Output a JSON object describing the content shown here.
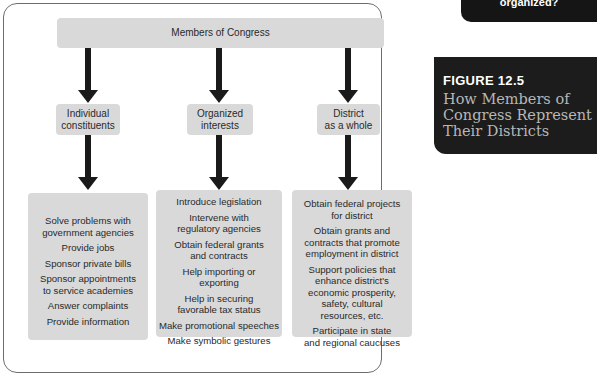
{
  "figure": {
    "label": "FIGURE 12.5",
    "title": "How Members of\nCongress Represent\nTheir Districts",
    "colors": {
      "panel_bg": "#1c1c1c",
      "label_color": "#ffffff",
      "title_color": "#b7b7b7",
      "box_fill": "#d9d9d9",
      "arrow_color": "#1a1a1a",
      "frame_border": "#6d6d6d"
    }
  },
  "top_cropped_box": {
    "text": "organized?"
  },
  "diagram": {
    "root": "Members of Congress",
    "branches": [
      {
        "label": "Individual\nconstituents",
        "items": [
          "Solve problems with\ngovernment agencies",
          "Provide jobs",
          "Sponsor private bills",
          "Sponsor appointments\nto service academies",
          "Answer complaints",
          "Provide information"
        ]
      },
      {
        "label": "Organized\ninterests",
        "items": [
          "Introduce legislation",
          "Intervene with\nregulatory agencies",
          "Obtain federal grants\nand contracts",
          "Help importing or\nexporting",
          "Help in securing\nfavorable tax status",
          "Make promotional speeches",
          "Make symbolic gestures"
        ]
      },
      {
        "label": "District\nas a whole",
        "items": [
          "Obtain federal projects\nfor district",
          "Obtain grants and\ncontracts that promote\nemployment in district",
          "Support policies that\nenhance district's\neconomic prosperity,\nsafety, cultural\nresources, etc.",
          "Participate in state\nand regional caucuses"
        ]
      }
    ]
  }
}
